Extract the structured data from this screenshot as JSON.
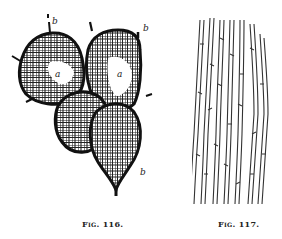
{
  "figures": [
    {
      "id": "fig-116",
      "caption": "Fig. 116.",
      "description": "Cluster of net-veined reticulate cells with marked points",
      "labels": [
        "a",
        "a",
        "b",
        "b",
        "b"
      ]
    },
    {
      "id": "fig-117",
      "caption": "Fig. 117.",
      "description": "Elongated tissue cells in vertical parallel strands"
    }
  ],
  "colors": {
    "ink": "#1a1a1a",
    "paper": "#ffffff"
  }
}
